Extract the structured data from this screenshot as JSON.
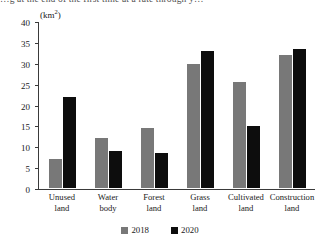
{
  "top_cropped_text": "…g at the end of the first time at a rate through y…",
  "unit_label": "(km",
  "unit_sup": "2",
  "unit_close": ")",
  "legend": {
    "position": "bottom-center",
    "items": [
      {
        "label": "2018",
        "color": "#787878",
        "swatch": "series-swatch"
      },
      {
        "label": "2020",
        "color": "#0d0d0d",
        "swatch": "series-swatch"
      }
    ]
  },
  "axis": {
    "y_ticks": [
      "40",
      "35",
      "30",
      "25",
      "20",
      "15",
      "10",
      "5",
      "0"
    ],
    "y_tick_values": [
      40,
      35,
      30,
      25,
      20,
      15,
      10,
      5,
      0
    ]
  },
  "chart_data": {
    "type": "bar",
    "title": "",
    "xlabel": "",
    "ylabel": "(km²)",
    "ylim": [
      0,
      40
    ],
    "ytick_step": 5,
    "grid": false,
    "legend_position": "bottom-center",
    "categories": [
      "Unused\nland",
      "Water\nbody",
      "Forest\nland",
      "Grass\nland",
      "Cultivated\nland",
      "Construction\nland"
    ],
    "series": [
      {
        "name": "2018",
        "color": "#787878",
        "values": [
          7,
          12,
          14.5,
          30,
          25.5,
          32
        ]
      },
      {
        "name": "2020",
        "color": "#0d0d0d",
        "values": [
          22,
          9,
          8.5,
          33,
          15,
          33.5
        ]
      }
    ]
  }
}
